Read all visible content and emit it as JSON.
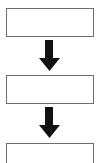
{
  "diagram": {
    "type": "vertical-flowchart",
    "colors": {
      "box_border": "#6e6e6e",
      "box_fill": "#ffffff",
      "arrow": "#111111",
      "background": "#ffffff"
    },
    "nodes": [
      {
        "id": "step-1",
        "label": ""
      },
      {
        "id": "step-2",
        "label": ""
      },
      {
        "id": "step-3",
        "label": ""
      }
    ],
    "edges": [
      {
        "from": "step-1",
        "to": "step-2",
        "icon": "down-arrow-icon"
      },
      {
        "from": "step-2",
        "to": "step-3",
        "icon": "down-arrow-icon"
      }
    ]
  }
}
